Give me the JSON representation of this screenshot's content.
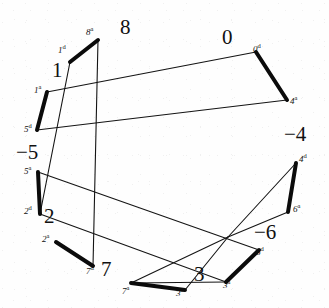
{
  "figure": {
    "title": "",
    "width": 329,
    "height": 308,
    "background_color": "#ffffff",
    "ink_color": "#111111",
    "thick_stroke_width": 4.0,
    "thin_stroke_width": 1.1
  },
  "chart_data": {
    "type": "diagram",
    "title": "",
    "xlabel": "",
    "ylabel": "",
    "face_numbers": [
      "8",
      "0",
      "1",
      "-5",
      "-4",
      "2",
      "-6",
      "7",
      "3"
    ],
    "edge_endpoint_labels": [
      "8a",
      "1d",
      "0d",
      "4a",
      "1a",
      "5d",
      "5a",
      "2d",
      "2a",
      "7d",
      "4d",
      "6a",
      "6d",
      "3a",
      "7a",
      "3d"
    ],
    "vertices": {
      "v8a": [
        98,
        40
      ],
      "v1d": [
        70,
        62
      ],
      "v0d": [
        256,
        52
      ],
      "v4a": [
        287,
        100
      ],
      "v1a": [
        47,
        92
      ],
      "v5d": [
        37,
        130
      ],
      "v5a": [
        38,
        172
      ],
      "v2d": [
        40,
        214
      ],
      "v2a": [
        56,
        242
      ],
      "v7d": [
        93,
        266
      ],
      "v4d": [
        296,
        163
      ],
      "v6a": [
        288,
        212
      ],
      "v6d": [
        259,
        250
      ],
      "v3a": [
        226,
        282
      ],
      "v7a": [
        131,
        283
      ],
      "v3d": [
        185,
        290
      ],
      "vcross": [
        228,
        237
      ]
    },
    "thick_edges": [
      [
        "v1d",
        "v8a"
      ],
      [
        "v0d",
        "v4a"
      ],
      [
        "v1a",
        "v5d"
      ],
      [
        "v5a",
        "v2d"
      ],
      [
        "v2a",
        "v7d"
      ],
      [
        "v4d",
        "v6a"
      ],
      [
        "v6d",
        "v3a"
      ],
      [
        "v7a",
        "v3d"
      ]
    ],
    "thin_edges": [
      [
        "v1a",
        "v0d"
      ],
      [
        "v5d",
        "v4a"
      ],
      [
        "v1d",
        "v2d"
      ],
      [
        "v8a",
        "v7d"
      ],
      [
        "v5a",
        "v6d"
      ],
      [
        "v2d",
        "v3a"
      ],
      [
        "v4d",
        "vcross"
      ],
      [
        "v6a",
        "vcross"
      ],
      [
        "v3d",
        "vcross"
      ],
      [
        "v7a",
        "v3a"
      ],
      [
        "v7a",
        "vcross"
      ]
    ]
  },
  "labels": {
    "faces": [
      {
        "text": "8",
        "x": 120,
        "y": 17
      },
      {
        "text": "0",
        "x": 222,
        "y": 27
      },
      {
        "text": "1",
        "x": 52,
        "y": 60
      },
      {
        "text": "−5",
        "x": 16,
        "y": 142
      },
      {
        "text": "−4",
        "x": 284,
        "y": 124
      },
      {
        "text": "2",
        "x": 44,
        "y": 206
      },
      {
        "text": "−6",
        "x": 254,
        "y": 222
      },
      {
        "text": "7",
        "x": 101,
        "y": 259
      },
      {
        "text": "3",
        "x": 194,
        "y": 264
      }
    ],
    "endpoints": [
      {
        "base": "8",
        "sup": "a",
        "x": 86,
        "y": 26
      },
      {
        "base": "1",
        "sup": "d",
        "x": 58,
        "y": 44
      },
      {
        "base": "0",
        "sup": "d",
        "x": 253,
        "y": 43
      },
      {
        "base": "4",
        "sup": "a",
        "x": 290,
        "y": 95
      },
      {
        "base": "1",
        "sup": "a",
        "x": 34,
        "y": 84
      },
      {
        "base": "5",
        "sup": "d",
        "x": 24,
        "y": 123
      },
      {
        "base": "5",
        "sup": "a",
        "x": 24,
        "y": 165
      },
      {
        "base": "2",
        "sup": "d",
        "x": 24,
        "y": 205
      },
      {
        "base": "2",
        "sup": "a",
        "x": 42,
        "y": 233
      },
      {
        "base": "7",
        "sup": "d",
        "x": 86,
        "y": 265
      },
      {
        "base": "4",
        "sup": "d",
        "x": 299,
        "y": 153
      },
      {
        "base": "6",
        "sup": "a",
        "x": 293,
        "y": 203
      },
      {
        "base": "6",
        "sup": "d",
        "x": 256,
        "y": 246
      },
      {
        "base": "3",
        "sup": "a",
        "x": 223,
        "y": 279
      },
      {
        "base": "7",
        "sup": "a",
        "x": 122,
        "y": 285
      },
      {
        "base": "3",
        "sup": "d",
        "x": 176,
        "y": 287
      }
    ]
  }
}
